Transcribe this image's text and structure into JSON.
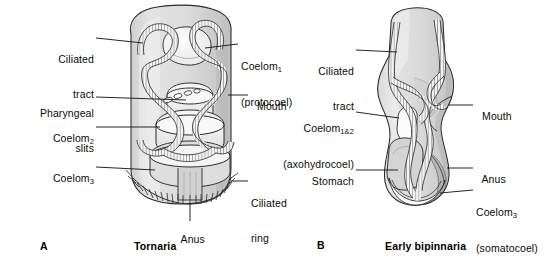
{
  "figure": {
    "background_color": "#ffffff",
    "ink_color": "#1a1a1a",
    "body_fill": "#dcdcdc",
    "body_fill_dark": "#c4c4c4",
    "body_fill_light": "#efefef",
    "panels": [
      {
        "letter": "A",
        "caption": "Tornaria",
        "organism": "tornaria larva of hemichordate",
        "labels": [
          {
            "id": "ciliated-tract",
            "text": "Ciliated\ntract",
            "line1": "Ciliated",
            "line2": "tract",
            "side": "left"
          },
          {
            "id": "pharyngeal-slits",
            "text": "Pharyngeal\nslits",
            "line1": "Pharyngeal",
            "line2": "slits",
            "side": "left"
          },
          {
            "id": "coelom-2",
            "text": "Coelom2",
            "line1": "Coelom",
            "sub": "2",
            "side": "left"
          },
          {
            "id": "coelom-3",
            "text": "Coelom3",
            "line1": "Coelom",
            "sub": "3",
            "side": "left"
          },
          {
            "id": "coelom-1",
            "text": "Coelom1 (protocoel)",
            "line1": "Coelom",
            "sub": "1",
            "line2": "(protocoel)",
            "side": "right"
          },
          {
            "id": "mouth",
            "text": "Mouth",
            "line1": "Mouth",
            "side": "right"
          },
          {
            "id": "ciliated-ring",
            "text": "Ciliated\nring",
            "line1": "Ciliated",
            "line2": "ring",
            "side": "right"
          },
          {
            "id": "anus",
            "text": "Anus",
            "line1": "Anus",
            "side": "bottom"
          }
        ]
      },
      {
        "letter": "B",
        "caption": "Early bipinnaria",
        "organism": "early bipinnaria larva of echinoderm",
        "labels": [
          {
            "id": "ciliated-tract",
            "text": "Ciliated\ntract",
            "line1": "Ciliated",
            "line2": "tract",
            "side": "left"
          },
          {
            "id": "coelom-1and2",
            "text": "Coelom1&2 (axohydrocoel)",
            "line1": "Coelom",
            "sub": "1&2",
            "line2": "(axohydrocoel)",
            "side": "left"
          },
          {
            "id": "stomach",
            "text": "Stomach",
            "line1": "Stomach",
            "side": "left"
          },
          {
            "id": "mouth",
            "text": "Mouth",
            "line1": "Mouth",
            "side": "right"
          },
          {
            "id": "anus",
            "text": "Anus",
            "line1": "Anus",
            "side": "right"
          },
          {
            "id": "coelom-3",
            "text": "Coelom3 (somatocoel)",
            "line1": "Coelom",
            "sub": "3",
            "line2": "(somatocoel)",
            "side": "right"
          }
        ]
      }
    ]
  }
}
